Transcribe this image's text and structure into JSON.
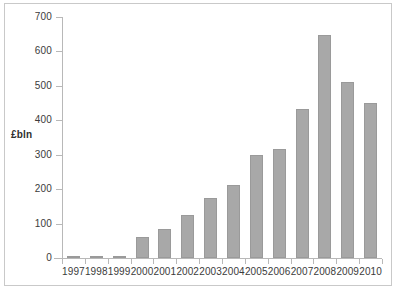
{
  "chart_data": {
    "type": "bar",
    "title": "",
    "xlabel": "",
    "ylabel": "£bln",
    "categories": [
      "1997",
      "1998",
      "1999",
      "2000",
      "2001",
      "2002",
      "2003",
      "2004",
      "2005",
      "2006",
      "2007",
      "2008",
      "2009",
      "2010"
    ],
    "values": [
      5,
      6,
      7,
      61,
      84,
      125,
      175,
      212,
      298,
      318,
      433,
      648,
      511,
      449
    ],
    "series": [
      {
        "name": "£bln",
        "values": [
          5,
          6,
          7,
          61,
          84,
          125,
          175,
          212,
          298,
          318,
          433,
          648,
          511,
          449
        ]
      }
    ],
    "ylim": [
      0,
      700
    ],
    "ytick_labels": [
      "0",
      "100",
      "200",
      "300",
      "400",
      "500",
      "600",
      "700"
    ],
    "ytick_values": [
      0,
      100,
      200,
      300,
      400,
      500,
      600,
      700
    ],
    "grid": false,
    "legend": false,
    "legend_position": "none",
    "bar_color": "#a8a8a8",
    "bar_edge_color": "#9a9a9a",
    "axis_color": "#b8b8b8",
    "text_color": "#3b3b3b",
    "background_color": "#ffffff",
    "frame_color": "#c9c9c9"
  }
}
